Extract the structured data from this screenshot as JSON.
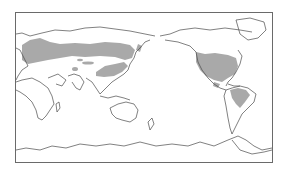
{
  "map": {
    "projection": "Pacific-centered equirectangular world map",
    "center_longitude": "150E",
    "shade_color": "#a9a9a9",
    "coastline_color": "#4a4a4a",
    "frame_color": "#6a6a6a",
    "background_color": "#ffffff",
    "shaded_regions": [
      "Europe",
      "Northern Eurasia (boreal/temperate belt)",
      "Central Asia patches",
      "Eastern China",
      "Korea / Japan",
      "Western North America",
      "Eastern United States / southern Canada",
      "Central Mexico",
      "Northern South America (Brazil highlands)"
    ],
    "labels": []
  }
}
